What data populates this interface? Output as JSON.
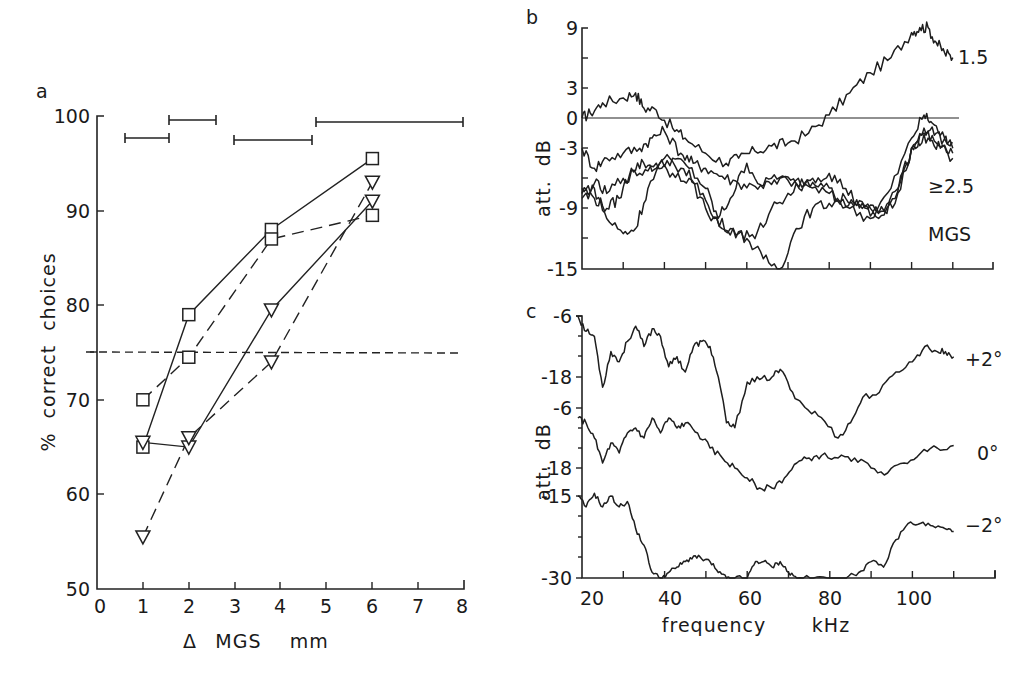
{
  "figure": {
    "panels": [
      "a",
      "b",
      "c"
    ]
  },
  "chart_data": [
    {
      "panel": "a",
      "type": "line",
      "title": "",
      "xlabel": "Δ MGS mm",
      "ylabel": "% correct choices",
      "xlim": [
        0,
        8
      ],
      "ylim": [
        50,
        100
      ],
      "xticks": [
        0,
        1,
        2,
        3,
        4,
        5,
        6,
        7,
        8
      ],
      "yticks": [
        50,
        60,
        70,
        80,
        90,
        100
      ],
      "threshold_line": {
        "y": 75,
        "style": "dashed"
      },
      "range_bars": [
        {
          "x_start": 0.6,
          "x_end": 1.6,
          "y": 97.5
        },
        {
          "x_start": 1.6,
          "x_end": 2.6,
          "y": 99.4
        },
        {
          "x_start": 3.0,
          "x_end": 4.7,
          "y": 97.3
        },
        {
          "x_start": 4.8,
          "x_end": 8.0,
          "y": 99.2
        }
      ],
      "series": [
        {
          "name": "squares, solid",
          "marker": "square",
          "line": "solid",
          "x": [
            1,
            2,
            3.8,
            6
          ],
          "values": [
            65,
            79,
            88,
            95.5
          ]
        },
        {
          "name": "squares, dashed",
          "marker": "square",
          "line": "dashed",
          "x": [
            1,
            2,
            3.8,
            6
          ],
          "values": [
            70,
            74.5,
            87,
            89.5
          ]
        },
        {
          "name": "triangles, solid",
          "marker": "triangle-down",
          "line": "solid",
          "x": [
            1,
            2,
            3.8,
            6
          ],
          "values": [
            65.5,
            65,
            79.5,
            91
          ]
        },
        {
          "name": "triangles, dashed",
          "marker": "triangle-down",
          "line": "dashed",
          "x": [
            1,
            2,
            3.8,
            6
          ],
          "values": [
            55.5,
            66,
            74,
            93
          ]
        }
      ]
    },
    {
      "panel": "b",
      "type": "line",
      "xlabel": "",
      "ylabel": "att. dB",
      "xlim": [
        20,
        120
      ],
      "ylim": [
        -15,
        9
      ],
      "yticks": [
        9,
        3,
        0,
        -3,
        -9,
        -15
      ],
      "ytick_labels": [
        "9",
        "3",
        "0",
        "-3",
        "-9",
        "-15"
      ],
      "zero_line": true,
      "annotations": [
        "1.5",
        "≥2.5",
        "MGS"
      ],
      "series": [
        {
          "name": "1.5 MGS",
          "x": [
            20,
            22,
            25,
            30,
            33,
            35,
            38,
            42,
            45,
            50,
            55,
            58,
            62,
            66,
            70,
            75,
            80,
            85,
            90,
            95,
            100,
            102,
            104,
            106,
            108,
            110
          ],
          "values": [
            0,
            0.5,
            1.5,
            2,
            2.5,
            1,
            0.8,
            -1,
            -2,
            -3.5,
            -4.5,
            -4,
            -3.3,
            -2.8,
            -2.5,
            -1.5,
            0.3,
            2.5,
            4.5,
            6,
            8.5,
            9,
            9,
            7.5,
            6.5,
            6
          ]
        },
        {
          "name": "≥2.5 MGS trace 1",
          "x": [
            20,
            23,
            26,
            30,
            34,
            37,
            40,
            44,
            47,
            50,
            54,
            58,
            62,
            66,
            70,
            75,
            80,
            85,
            90,
            95,
            100,
            103,
            105,
            108,
            110
          ],
          "values": [
            -3,
            -5,
            -4,
            -3.5,
            -3,
            -2,
            -1.3,
            -3.5,
            -4.5,
            -5,
            -5.8,
            -6.5,
            -6.8,
            -6,
            -6.2,
            -6.8,
            -7.5,
            -9,
            -10,
            -7,
            -2,
            0.3,
            -0.5,
            -2,
            -2.5
          ]
        },
        {
          "name": "≥2.5 MGS trace 2",
          "x": [
            20,
            23,
            26,
            29,
            32,
            35,
            38,
            42,
            46,
            50,
            53,
            56,
            60,
            64,
            68,
            72,
            76,
            80,
            84,
            88,
            92,
            96,
            100,
            103,
            106,
            110
          ],
          "values": [
            -7,
            -8,
            -9,
            -8,
            -5,
            -4.5,
            -5,
            -4,
            -5,
            -7,
            -10,
            -8,
            -4.5,
            -7,
            -6,
            -6.5,
            -6,
            -5.5,
            -7,
            -9,
            -10,
            -8,
            -3,
            -1,
            -1.5,
            -3
          ]
        },
        {
          "name": "≥2.5 MGS trace 3",
          "x": [
            20,
            23,
            26,
            30,
            33,
            36,
            40,
            44,
            48,
            52,
            56,
            60,
            64,
            68,
            72,
            76,
            80,
            84,
            88,
            92,
            96,
            100,
            103,
            106,
            110
          ],
          "values": [
            -8,
            -7,
            -10,
            -11.5,
            -11,
            -7,
            -4,
            -5,
            -6.5,
            -10,
            -11,
            -12,
            -14,
            -15,
            -11,
            -9,
            -8.5,
            -8,
            -8.5,
            -9.5,
            -8.5,
            -3,
            -1.5,
            -2.5,
            -4
          ]
        },
        {
          "name": "≥2.5 MGS trace 4",
          "x": [
            20,
            23,
            26,
            30,
            34,
            38,
            42,
            46,
            50,
            54,
            58,
            62,
            66,
            70,
            74,
            78,
            82,
            86,
            90,
            94,
            98,
            101,
            104,
            107,
            110
          ],
          "values": [
            -7.5,
            -6.5,
            -7.5,
            -6,
            -5.5,
            -4.5,
            -5.5,
            -6,
            -9,
            -11,
            -11.5,
            -12,
            -9,
            -7.5,
            -6.5,
            -6.5,
            -8,
            -8.5,
            -9,
            -9.5,
            -5,
            -2.5,
            -2,
            -3,
            -3.5
          ]
        }
      ]
    },
    {
      "panel": "c",
      "type": "line",
      "xlabel": "frequency kHz",
      "ylabel": "att. dB",
      "xlim": [
        18,
        120
      ],
      "xticks": [
        20,
        40,
        60,
        80,
        100
      ],
      "subplots": [
        {
          "label": "+2°",
          "ylim": [
            -18,
            -6
          ],
          "yticks": [
            -6,
            -18
          ],
          "x": [
            19,
            21,
            23,
            25,
            27,
            29,
            31,
            33,
            35,
            37,
            39,
            41,
            43,
            45,
            47,
            49,
            51,
            53,
            55,
            57,
            60,
            63,
            66,
            68,
            71,
            74,
            78,
            82,
            85,
            88,
            92,
            96,
            100,
            103,
            106,
            108,
            110
          ],
          "values": [
            -6,
            -9,
            -10,
            -20,
            -13,
            -15,
            -11,
            -8,
            -12,
            -8.5,
            -10,
            -16,
            -14,
            -17,
            -12,
            -11,
            -12,
            -18,
            -27,
            -28,
            -19,
            -18.5,
            -18,
            -16.5,
            -21,
            -24,
            -26,
            -30,
            -27,
            -22,
            -21,
            -17,
            -15,
            -12,
            -13,
            -13,
            -14
          ]
        },
        {
          "label": "0°",
          "ylim": [
            -18,
            -6
          ],
          "yticks": [
            -6,
            -18
          ],
          "x": [
            19,
            21,
            23,
            25,
            27,
            29,
            31,
            33,
            35,
            37,
            39,
            41,
            43,
            45,
            48,
            51,
            54,
            57,
            60,
            63,
            66,
            69,
            72,
            75,
            78,
            82,
            86,
            90,
            94,
            98,
            102,
            106,
            110
          ],
          "values": [
            -8,
            -9,
            -12,
            -17,
            -13,
            -15,
            -11,
            -10,
            -12,
            -8,
            -11,
            -8,
            -10,
            -9,
            -11,
            -14,
            -16,
            -18,
            -20,
            -22,
            -22,
            -20,
            -17,
            -16,
            -15.5,
            -16,
            -16,
            -18,
            -19,
            -17,
            -15,
            -14,
            -13.5
          ]
        },
        {
          "label": "-2°",
          "ylim": [
            -30,
            -15
          ],
          "yticks": [
            -15,
            -30
          ],
          "x": [
            19,
            21,
            23,
            25,
            27,
            29,
            31,
            33,
            35,
            37,
            39,
            41,
            43,
            45,
            47,
            49,
            51,
            53,
            55,
            57,
            60,
            62,
            64,
            66,
            68,
            70,
            72,
            76,
            80,
            84,
            87,
            90,
            93,
            96,
            99,
            102,
            105,
            108,
            110
          ],
          "values": [
            -15,
            -17,
            -14.5,
            -17,
            -15,
            -17,
            -16,
            -21,
            -24,
            -29,
            -30,
            -29,
            -28,
            -27,
            -26,
            -26.5,
            -27,
            -29,
            -30,
            -30,
            -30,
            -27,
            -27,
            -28,
            -27,
            -29,
            -30,
            -30,
            -30,
            -30,
            -29,
            -27,
            -28,
            -23,
            -20,
            -20,
            -20.5,
            -21,
            -21.5
          ]
        }
      ]
    }
  ],
  "labels": {
    "a": {
      "panel_letter": "a",
      "ylabel": "%  correct  choices",
      "xlabel_delta": "Δ",
      "xlabel_text": "MGS    mm",
      "yticks": [
        "50",
        "60",
        "70",
        "80",
        "90",
        "100"
      ],
      "xticks": [
        "0",
        "1",
        "2",
        "3",
        "4",
        "5",
        "6",
        "7",
        "8"
      ]
    },
    "b": {
      "panel_letter": "b",
      "ylabel": "att.  dB",
      "yticks": [
        "9",
        "3",
        "0",
        "-3",
        "-9",
        "-15"
      ],
      "ann_top": "1.5",
      "ann_mid": "≥2.5",
      "ann_bot": "MGS"
    },
    "c": {
      "panel_letter": "c",
      "ylabel": "att.  dB",
      "yticks_top": [
        "-6",
        "-18"
      ],
      "yticks_mid": [
        "-6",
        "-18"
      ],
      "yticks_bot": [
        "-15",
        "-30"
      ],
      "xticks": [
        "20",
        "40",
        "60",
        "80",
        "100"
      ],
      "xlabel_freq": "frequency",
      "xlabel_unit": "kHz",
      "curve_labels": [
        "+2°",
        "0°",
        "−2°"
      ]
    }
  }
}
